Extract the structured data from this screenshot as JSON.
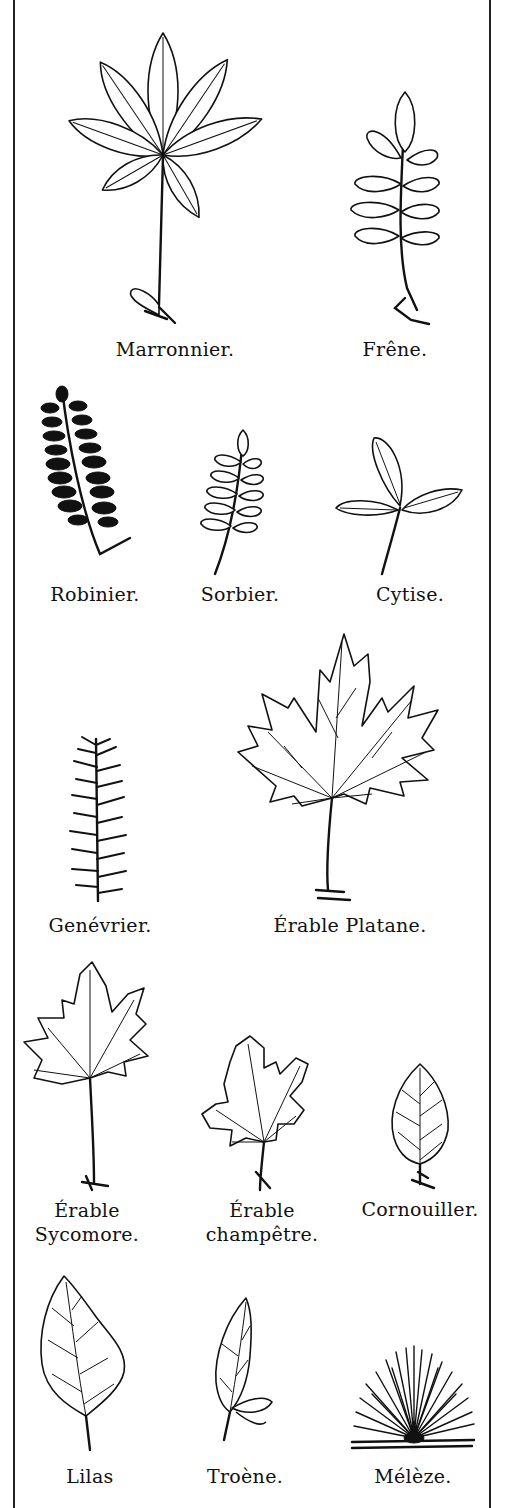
{
  "plate": {
    "border_color": "#222222",
    "background": "#ffffff",
    "leaves": [
      {
        "id": "marronnier",
        "label": "Marronnier."
      },
      {
        "id": "frene",
        "label": "Frêne."
      },
      {
        "id": "robinier",
        "label": "Robinier."
      },
      {
        "id": "sorbier",
        "label": "Sorbier."
      },
      {
        "id": "cytise",
        "label": "Cytise."
      },
      {
        "id": "genevrier",
        "label": "Genévrier."
      },
      {
        "id": "erable-platane",
        "label": "Érable Platane."
      },
      {
        "id": "erable-sycomore",
        "label_line1": "Érable",
        "label_line2": "Sycomore."
      },
      {
        "id": "erable-champetre",
        "label_line1": "Érable",
        "label_line2": "champêtre."
      },
      {
        "id": "cornouiller",
        "label": "Cornouiller."
      },
      {
        "id": "lilas",
        "label": "Lilas"
      },
      {
        "id": "troene",
        "label": "Troène."
      },
      {
        "id": "meleze",
        "label": "Mélèze."
      }
    ]
  }
}
